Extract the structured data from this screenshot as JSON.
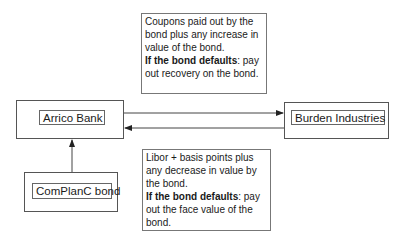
{
  "diagram": {
    "nodes": {
      "arrico": {
        "label": "Arrico Bank"
      },
      "burden": {
        "label": "Burden Industries"
      },
      "complanc": {
        "label": "ComPlanC bond"
      }
    },
    "notes": {
      "top": {
        "text": "Coupons paid out by the bond plus any increase in value of the bond.",
        "default_label": "If the bond defaults",
        "default_text": ": pay out recovery on the bond."
      },
      "bottom": {
        "text": "Libor + basis points plus any decrease in value by the bond.",
        "default_label": "If the bond defaults",
        "default_text": ": pay out the face value of the bond."
      }
    },
    "edges": [
      {
        "from": "Arrico Bank",
        "to": "Burden Industries",
        "label": "top note"
      },
      {
        "from": "Burden Industries",
        "to": "Arrico Bank",
        "label": "bottom note"
      },
      {
        "from": "ComPlanC bond",
        "to": "Arrico Bank"
      }
    ],
    "colors": {
      "line": "#333333",
      "border": "#555555",
      "background": "#ffffff"
    }
  }
}
